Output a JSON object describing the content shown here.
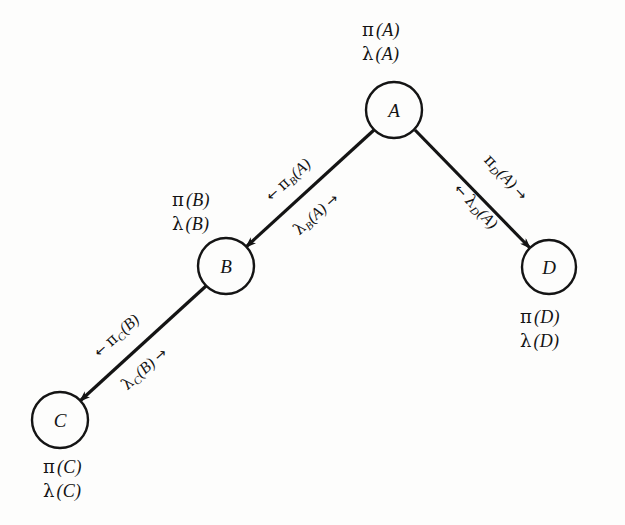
{
  "figure": {
    "background_color": "#fdfdfc",
    "ink_color": "#141414"
  },
  "nodes": [
    {
      "id": "A",
      "label": "A",
      "cx": 394,
      "cy": 110,
      "r": 28
    },
    {
      "id": "B",
      "label": "B",
      "cx": 226,
      "cy": 266,
      "r": 28
    },
    {
      "id": "C",
      "label": "C",
      "cx": 60,
      "cy": 420,
      "r": 28
    },
    {
      "id": "D",
      "label": "D",
      "cx": 549,
      "cy": 267,
      "r": 27
    }
  ],
  "edges": [
    {
      "id": "A-B",
      "from": "A",
      "to": "B",
      "x1": 374,
      "y1": 130,
      "x2": 246,
      "y2": 247,
      "arrow_at": "B"
    },
    {
      "id": "B-C",
      "from": "B",
      "to": "C",
      "x1": 206,
      "y1": 286,
      "x2": 80,
      "y2": 401,
      "arrow_at": "C"
    },
    {
      "id": "A-D",
      "from": "A",
      "to": "D",
      "x1": 415,
      "y1": 130,
      "x2": 530,
      "y2": 248,
      "arrow_at": "D"
    }
  ],
  "belief_labels": [
    {
      "id": "A",
      "pi": {
        "greek": "π",
        "arg": "(A)"
      },
      "lambda": {
        "greek": "λ",
        "arg": "(A)"
      },
      "x": 362,
      "y": 18
    },
    {
      "id": "B",
      "pi": {
        "greek": "π",
        "arg": "(B)"
      },
      "lambda": {
        "greek": "λ",
        "arg": "(B)"
      },
      "x": 172,
      "y": 188
    },
    {
      "id": "C",
      "pi": {
        "greek": "π",
        "arg": "(C)"
      },
      "lambda": {
        "greek": "λ",
        "arg": "(C)"
      },
      "x": 43,
      "y": 455
    },
    {
      "id": "D",
      "pi": {
        "greek": "π",
        "arg": "(D)"
      },
      "lambda": {
        "greek": "λ",
        "arg": "(D)"
      },
      "x": 520,
      "y": 305
    }
  ],
  "message_labels": [
    {
      "id": "pi-B-A",
      "edge": "A-B",
      "arrow_prefix": "←",
      "arrow_suffix": "",
      "greek": "π",
      "sub": "B",
      "arg": "(A)",
      "x": 268,
      "y": 188,
      "rotate": -42
    },
    {
      "id": "lambda-B-A",
      "edge": "A-B",
      "arrow_prefix": "",
      "arrow_suffix": "→",
      "greek": "λ",
      "sub": "B",
      "arg": "(A)",
      "x": 296,
      "y": 222,
      "rotate": -42
    },
    {
      "id": "pi-C-B",
      "edge": "B-C",
      "arrow_prefix": "←",
      "arrow_suffix": "",
      "greek": "π",
      "sub": "C",
      "arg": "(B)",
      "x": 96,
      "y": 344,
      "rotate": -42
    },
    {
      "id": "lambda-C-B",
      "edge": "B-C",
      "arrow_prefix": "",
      "arrow_suffix": "→",
      "greek": "λ",
      "sub": "C",
      "arg": "(B)",
      "x": 124,
      "y": 377,
      "rotate": -42
    },
    {
      "id": "pi-D-A",
      "edge": "A-D",
      "arrow_prefix": "",
      "arrow_suffix": "→",
      "greek": "π",
      "sub": "D",
      "arg": "(A)",
      "x": 487,
      "y": 147,
      "rotate": 47
    },
    {
      "id": "lambda-D-A",
      "edge": "A-D",
      "arrow_prefix": "←",
      "arrow_suffix": "",
      "greek": "λ",
      "sub": "D",
      "arg": "(A)",
      "x": 457,
      "y": 176,
      "rotate": 47
    }
  ]
}
